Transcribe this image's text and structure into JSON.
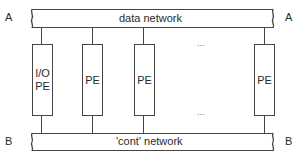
{
  "diagram": {
    "top_bus": {
      "label": "data network",
      "left_end": "A",
      "right_end": "A"
    },
    "bottom_bus": {
      "label": "'cont' network",
      "left_end": "B",
      "right_end": "B"
    },
    "processors": [
      {
        "line1": "I/O",
        "line2": "PE"
      },
      {
        "line1": "",
        "line2": "PE"
      },
      {
        "line1": "",
        "line2": "PE"
      },
      {
        "line1": "",
        "line2": "PE"
      }
    ],
    "ellipsis_top": "...",
    "ellipsis_bottom": "...",
    "colors": {
      "line": "#444444",
      "text": "#2a2a2a",
      "background": "#ffffff"
    }
  }
}
